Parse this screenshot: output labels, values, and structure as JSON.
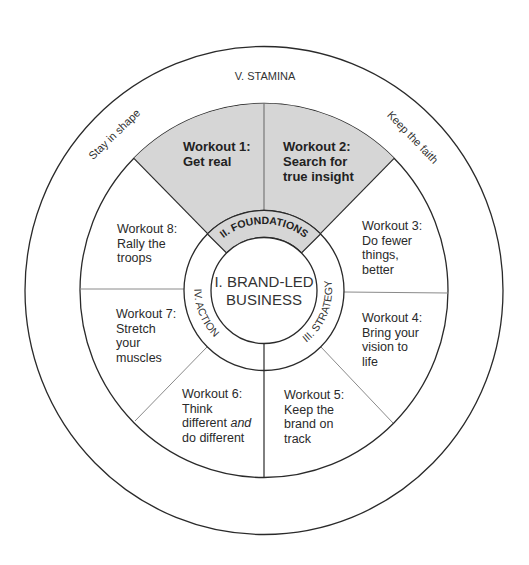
{
  "diagram": {
    "colors": {
      "highlight_fill": "#d6d6d6",
      "line_dark": "#2a2a2a",
      "line_light": "#8a8a8a",
      "background": "#ffffff"
    },
    "center": {
      "line1": "I. BRAND-LED",
      "line2": "BUSINESS"
    },
    "ring": {
      "top": "II. FOUNDATIONS",
      "right": "III. STRATEGY",
      "left": "IV. ACTION"
    },
    "outer": {
      "top": "V. STAMINA",
      "left": "Stay in shape",
      "right": "Keep the faith"
    },
    "workouts": [
      {
        "id": 1,
        "title": "Workout 1:",
        "lines": [
          "Get real"
        ],
        "highlighted": true
      },
      {
        "id": 2,
        "title": "Workout 2:",
        "lines": [
          "Search for",
          "true insight"
        ],
        "highlighted": true
      },
      {
        "id": 3,
        "title": "Workout 3:",
        "lines": [
          "Do fewer",
          "things,",
          "better"
        ],
        "highlighted": false
      },
      {
        "id": 4,
        "title": "Workout 4:",
        "lines": [
          "Bring your",
          "vision to",
          "life"
        ],
        "highlighted": false
      },
      {
        "id": 5,
        "title": "Workout 5:",
        "lines": [
          "Keep the",
          "brand on",
          "track"
        ],
        "highlighted": false
      },
      {
        "id": 6,
        "title": "Workout 6:",
        "lines": [
          "Think",
          "different",
          "do different"
        ],
        "italic_suffix": "and",
        "highlighted": false
      },
      {
        "id": 7,
        "title": "Workout 7:",
        "lines": [
          "Stretch",
          "your",
          "muscles"
        ],
        "highlighted": false
      },
      {
        "id": 8,
        "title": "Workout 8:",
        "lines": [
          "Rally the",
          "troops"
        ],
        "highlighted": false
      }
    ]
  }
}
